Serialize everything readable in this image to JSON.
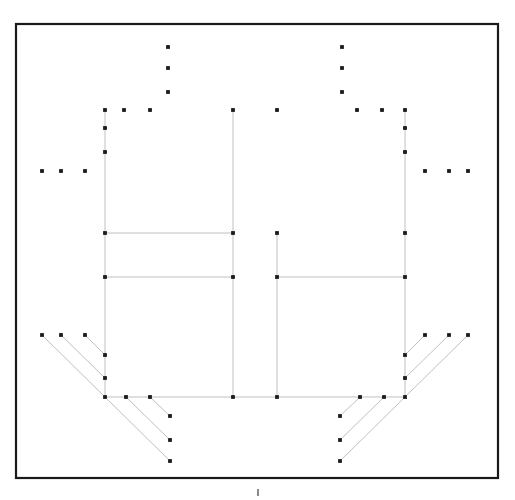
{
  "figure": {
    "caption": "",
    "background_color": "#ffffff",
    "frame": {
      "x": 16,
      "y": 24,
      "width": 482,
      "height": 454,
      "stroke_color": "#1a1a1a",
      "stroke_width": 2.2
    },
    "segment_color": "#b9b9bd",
    "segment_width": 0.9,
    "node_color": "#1b1b1f",
    "node_radius": 1.9
  },
  "chart_data": {
    "type": "scatter",
    "xlabel": "",
    "ylabel": "",
    "xlim": [
      16,
      498
    ],
    "ylim": [
      24,
      478
    ],
    "grid": false,
    "legend": "none",
    "segments": [
      {
        "name": "left-outer-vertical",
        "x1": 105,
        "y1": 110,
        "x2": 105,
        "y2": 397
      },
      {
        "name": "right-outer-vertical",
        "x1": 405,
        "y1": 110,
        "x2": 405,
        "y2": 397
      },
      {
        "name": "left-inner-vertical",
        "x1": 233,
        "y1": 110,
        "x2": 233,
        "y2": 397
      },
      {
        "name": "right-inner-vertical",
        "x1": 277,
        "y1": 233,
        "x2": 277,
        "y2": 397
      },
      {
        "name": "upper-left-horizontal",
        "x1": 105,
        "y1": 233,
        "x2": 233,
        "y2": 233
      },
      {
        "name": "mid-left-horizontal",
        "x1": 105,
        "y1": 277,
        "x2": 233,
        "y2": 277
      },
      {
        "name": "mid-right-horizontal",
        "x1": 277,
        "y1": 277,
        "x2": 405,
        "y2": 277
      },
      {
        "name": "base-horizontal",
        "x1": 105,
        "y1": 397,
        "x2": 405,
        "y2": 397
      },
      {
        "name": "left-fan-upper-1",
        "x1": 42,
        "y1": 335,
        "x2": 105,
        "y2": 397
      },
      {
        "name": "left-fan-upper-2",
        "x1": 61,
        "y1": 335,
        "x2": 105,
        "y2": 378
      },
      {
        "name": "left-fan-upper-3",
        "x1": 85,
        "y1": 335,
        "x2": 105,
        "y2": 355
      },
      {
        "name": "left-fan-lower-1",
        "x1": 105,
        "y1": 397,
        "x2": 170,
        "y2": 461
      },
      {
        "name": "left-fan-lower-2",
        "x1": 126,
        "y1": 397,
        "x2": 170,
        "y2": 440
      },
      {
        "name": "left-fan-lower-3",
        "x1": 150,
        "y1": 397,
        "x2": 170,
        "y2": 416
      },
      {
        "name": "right-fan-upper-1",
        "x1": 468,
        "y1": 335,
        "x2": 405,
        "y2": 397
      },
      {
        "name": "right-fan-upper-2",
        "x1": 449,
        "y1": 335,
        "x2": 405,
        "y2": 378
      },
      {
        "name": "right-fan-upper-3",
        "x1": 425,
        "y1": 335,
        "x2": 405,
        "y2": 355
      },
      {
        "name": "right-fan-lower-1",
        "x1": 405,
        "y1": 397,
        "x2": 340,
        "y2": 461
      },
      {
        "name": "right-fan-lower-2",
        "x1": 384,
        "y1": 397,
        "x2": 340,
        "y2": 440
      },
      {
        "name": "right-fan-lower-3",
        "x1": 360,
        "y1": 397,
        "x2": 340,
        "y2": 416
      }
    ],
    "points": [
      {
        "x": 168,
        "y": 47
      },
      {
        "x": 342,
        "y": 47
      },
      {
        "x": 168,
        "y": 68
      },
      {
        "x": 342,
        "y": 68
      },
      {
        "x": 168,
        "y": 92
      },
      {
        "x": 342,
        "y": 92
      },
      {
        "x": 105,
        "y": 110
      },
      {
        "x": 124,
        "y": 110
      },
      {
        "x": 150,
        "y": 110
      },
      {
        "x": 233,
        "y": 110
      },
      {
        "x": 277,
        "y": 110
      },
      {
        "x": 357,
        "y": 110
      },
      {
        "x": 382,
        "y": 110
      },
      {
        "x": 405,
        "y": 110
      },
      {
        "x": 105,
        "y": 128
      },
      {
        "x": 405,
        "y": 128
      },
      {
        "x": 105,
        "y": 152
      },
      {
        "x": 405,
        "y": 152
      },
      {
        "x": 42,
        "y": 171
      },
      {
        "x": 61,
        "y": 171
      },
      {
        "x": 85,
        "y": 171
      },
      {
        "x": 425,
        "y": 171
      },
      {
        "x": 449,
        "y": 171
      },
      {
        "x": 468,
        "y": 171
      },
      {
        "x": 105,
        "y": 233
      },
      {
        "x": 233,
        "y": 233
      },
      {
        "x": 277,
        "y": 233
      },
      {
        "x": 405,
        "y": 233
      },
      {
        "x": 105,
        "y": 277
      },
      {
        "x": 233,
        "y": 277
      },
      {
        "x": 277,
        "y": 277
      },
      {
        "x": 405,
        "y": 277
      },
      {
        "x": 42,
        "y": 335
      },
      {
        "x": 61,
        "y": 335
      },
      {
        "x": 85,
        "y": 335
      },
      {
        "x": 425,
        "y": 335
      },
      {
        "x": 449,
        "y": 335
      },
      {
        "x": 468,
        "y": 335
      },
      {
        "x": 105,
        "y": 355
      },
      {
        "x": 405,
        "y": 355
      },
      {
        "x": 105,
        "y": 378
      },
      {
        "x": 405,
        "y": 378
      },
      {
        "x": 105,
        "y": 397
      },
      {
        "x": 126,
        "y": 397
      },
      {
        "x": 150,
        "y": 397
      },
      {
        "x": 233,
        "y": 397
      },
      {
        "x": 277,
        "y": 397
      },
      {
        "x": 360,
        "y": 397
      },
      {
        "x": 384,
        "y": 397
      },
      {
        "x": 405,
        "y": 397
      },
      {
        "x": 170,
        "y": 416
      },
      {
        "x": 340,
        "y": 416
      },
      {
        "x": 170,
        "y": 440
      },
      {
        "x": 340,
        "y": 440
      },
      {
        "x": 170,
        "y": 461
      },
      {
        "x": 340,
        "y": 461
      }
    ],
    "annotations": [
      {
        "name": "bottom-tick",
        "x": 258,
        "y1": 489,
        "y2": 496
      }
    ]
  }
}
